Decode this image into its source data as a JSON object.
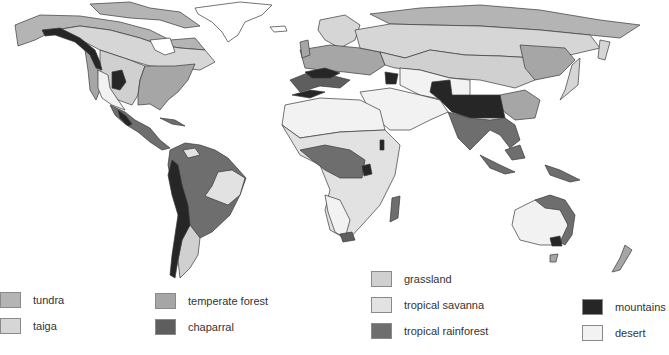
{
  "colors": {
    "tundra": "#b4b4b4",
    "taiga": "#d6d6d6",
    "temperate_forest": "#a6a6a6",
    "chaparral": "#5e5e5e",
    "grassland": "#d0d0d0",
    "tropical_savanna": "#e2e2e2",
    "tropical_rainforest": "#6e6e6e",
    "mountains": "#262626",
    "desert": "#f2f2f2",
    "ice": "#ffffff"
  },
  "legend": [
    {
      "key": "tundra",
      "label": "tundra",
      "color": "#b4b4b4"
    },
    {
      "key": "taiga",
      "label": "taiga",
      "color": "#d6d6d6"
    },
    {
      "key": "temperate_forest",
      "label": "temperate forest",
      "color": "#a6a6a6"
    },
    {
      "key": "chaparral",
      "label": "chaparral",
      "color": "#5e5e5e"
    },
    {
      "key": "grassland",
      "label": "grassland",
      "color": "#d0d0d0"
    },
    {
      "key": "tropical_savanna",
      "label": "tropical savanna",
      "color": "#e2e2e2"
    },
    {
      "key": "tropical_rainforest",
      "label": "tropical rainforest",
      "color": "#6e6e6e"
    },
    {
      "key": "mountains",
      "label": "mountains",
      "color": "#262626"
    },
    {
      "key": "desert",
      "label": "desert",
      "color": "#f2f2f2"
    }
  ]
}
